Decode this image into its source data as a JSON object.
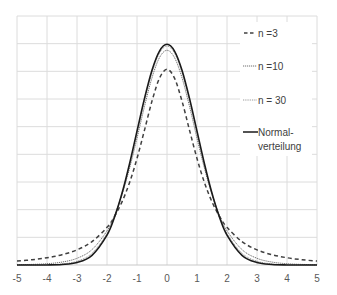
{
  "chart_data": {
    "type": "line",
    "title": "",
    "xlabel": "",
    "ylabel": "",
    "xlim": [
      -5,
      5
    ],
    "ylim": [
      0,
      0.45
    ],
    "x_ticks": [
      "-5",
      "-4",
      "-3",
      "-2",
      "-1",
      "0",
      "1",
      "2",
      "3",
      "4",
      "5"
    ],
    "y_ticks_shown": false,
    "y_grid_step": 0.05,
    "x_grid_step": 1,
    "grid": true,
    "legend_position": "upper right (inside plot)",
    "x": [
      -5,
      -4.5,
      -4,
      -3.5,
      -3,
      -2.5,
      -2,
      -1.75,
      -1.5,
      -1.25,
      -1,
      -0.75,
      -0.5,
      -0.25,
      0,
      0.25,
      0.5,
      0.75,
      1,
      1.25,
      1.5,
      1.75,
      2,
      2.5,
      3,
      3.5,
      4,
      4.5,
      5
    ],
    "series": [
      {
        "name": "n =3",
        "style": "dashed",
        "color": "#404040",
        "values": [
          0.0071,
          0.0095,
          0.0131,
          0.0186,
          0.0274,
          0.0422,
          0.068,
          0.0878,
          0.1141,
          0.1487,
          0.1925,
          0.2438,
          0.2963,
          0.3376,
          0.3536,
          0.3376,
          0.2963,
          0.2438,
          0.1925,
          0.1487,
          0.1141,
          0.0878,
          0.068,
          0.0422,
          0.0274,
          0.0186,
          0.0131,
          0.0095,
          0.0071
        ]
      },
      {
        "name": "n =10",
        "style": "dotted-fine",
        "color": "#606060",
        "values": [
          0.0005,
          0.0011,
          0.0023,
          0.0053,
          0.0121,
          0.0278,
          0.0618,
          0.0897,
          0.1272,
          0.1743,
          0.2291,
          0.2866,
          0.3384,
          0.3748,
          0.388,
          0.3748,
          0.3384,
          0.2866,
          0.2291,
          0.1743,
          0.1272,
          0.0897,
          0.0618,
          0.0278,
          0.0121,
          0.0053,
          0.0023,
          0.0011,
          0.0005
        ]
      },
      {
        "name": "n = 30",
        "style": "dotted",
        "color": "#808080",
        "values": [
          0.0,
          0.0001,
          0.0005,
          0.002,
          0.0069,
          0.0212,
          0.0568,
          0.0877,
          0.1288,
          0.1799,
          0.2378,
          0.2965,
          0.3478,
          0.3829,
          0.3955,
          0.3829,
          0.3478,
          0.2965,
          0.2378,
          0.1799,
          0.1288,
          0.0877,
          0.0568,
          0.0212,
          0.0069,
          0.002,
          0.0005,
          0.0001,
          0.0
        ]
      },
      {
        "name": "Normal-\nverteilung",
        "style": "solid",
        "color": "#1a1a1a",
        "values": [
          0.0,
          0.0,
          0.0001,
          0.0009,
          0.0044,
          0.0175,
          0.054,
          0.0863,
          0.1295,
          0.1826,
          0.242,
          0.3011,
          0.3521,
          0.3867,
          0.3989,
          0.3867,
          0.3521,
          0.3011,
          0.242,
          0.1826,
          0.1295,
          0.0863,
          0.054,
          0.0175,
          0.0044,
          0.0009,
          0.0001,
          0.0,
          0.0
        ]
      }
    ]
  },
  "legend": {
    "items": [
      {
        "label": "n =3"
      },
      {
        "label": "n =10"
      },
      {
        "label": "n = 30"
      },
      {
        "label_line1": "Normal-",
        "label_line2": "verteilung"
      }
    ]
  }
}
